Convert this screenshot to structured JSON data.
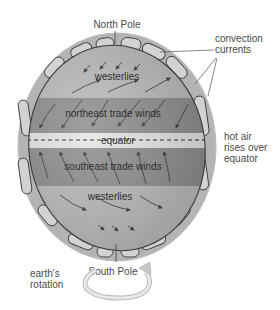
{
  "diagram": {
    "labels": {
      "north_pole": "North Pole",
      "south_pole": "South Pole",
      "convection_line1": "convection",
      "convection_line2": "currents",
      "hot_air_line1": "hot air",
      "hot_air_line2": "rises over",
      "hot_air_line3": "equator",
      "rotation_line1": "earth's",
      "rotation_line2": "rotation"
    },
    "bands": [
      {
        "name": "westerlies",
        "label": "westerlies",
        "hemisphere": "north"
      },
      {
        "name": "northeast-trade-winds",
        "label": "northeast trade winds",
        "hemisphere": "north"
      },
      {
        "name": "equator",
        "label": "equator",
        "hemisphere": "equator"
      },
      {
        "name": "southeast-trade-winds",
        "label": "southeast trade winds",
        "hemisphere": "south"
      },
      {
        "name": "westerlies-south",
        "label": "westerlies",
        "hemisphere": "south"
      }
    ],
    "colors": {
      "outer_ring": "#b4b4b4",
      "cell": "#d0d0d0",
      "westerlies": "#bcbcbc",
      "trade_winds": "#8e8e8e",
      "equator": "#e6e6e6",
      "outline": "#3a3a3a",
      "text": "#4a4a4a"
    }
  }
}
